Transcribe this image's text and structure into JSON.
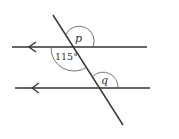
{
  "diagram": {
    "type": "parallel-lines-transversal",
    "colors": {
      "line": "#333333",
      "background": "#ffffff"
    },
    "parallel_lines": [
      {
        "name": "top-line",
        "direction_arrow": "left"
      },
      {
        "name": "bottom-line",
        "direction_arrow": "left"
      }
    ],
    "angles": {
      "p": "p",
      "given": "115°",
      "q": "q"
    }
  }
}
